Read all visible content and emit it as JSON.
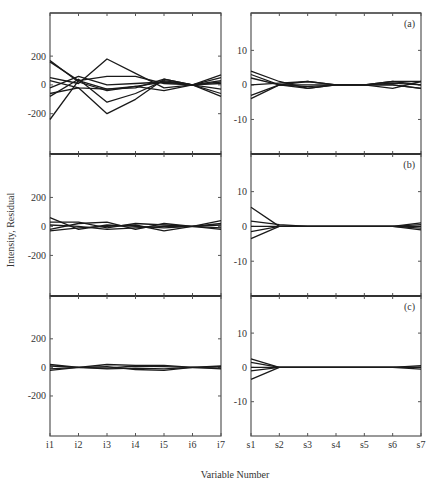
{
  "chart_data": {
    "type": "line",
    "layout": "3x2 stacked panels",
    "ylabel": "Intensity, Residual",
    "xlabel": "Variable Number",
    "grid": false,
    "legend": null,
    "panels": [
      {
        "tag": "(a)",
        "row": 0,
        "col": 0,
        "x": [
          "i1",
          "i2",
          "i3",
          "i4",
          "i5",
          "i6",
          "i7"
        ],
        "yticks": [
          200,
          0,
          -200
        ],
        "ylim": [
          -480,
          480
        ],
        "series": [
          {
            "name": "s1",
            "values": [
              170,
              20,
              -40,
              -10,
              20,
              0,
              70
            ]
          },
          {
            "name": "s2",
            "values": [
              160,
              30,
              -30,
              -20,
              40,
              0,
              -80
            ]
          },
          {
            "name": "s3",
            "values": [
              50,
              10,
              180,
              80,
              -20,
              0,
              50
            ]
          },
          {
            "name": "s4",
            "values": [
              -240,
              30,
              60,
              60,
              10,
              0,
              30
            ]
          },
          {
            "name": "s5",
            "values": [
              -60,
              -20,
              -200,
              -100,
              40,
              0,
              -30
            ]
          },
          {
            "name": "s6",
            "values": [
              -80,
              40,
              -120,
              -60,
              30,
              0,
              -60
            ]
          },
          {
            "name": "s7",
            "values": [
              30,
              -20,
              -30,
              -10,
              -40,
              0,
              10
            ]
          },
          {
            "name": "s8",
            "values": [
              -20,
              60,
              0,
              10,
              20,
              0,
              20
            ]
          }
        ]
      },
      {
        "tag": "(a)",
        "row": 0,
        "col": 1,
        "x": [
          "s1",
          "s2",
          "s3",
          "s4",
          "s5",
          "s6",
          "s7"
        ],
        "yticks": [
          10,
          0,
          -10
        ],
        "ylim": [
          -20,
          20
        ],
        "series": [
          {
            "name": "s1",
            "values": [
              4,
              1,
              -1,
              0,
              0,
              1,
              1
            ]
          },
          {
            "name": "s2",
            "values": [
              3,
              0,
              1,
              0,
              0,
              0,
              -1
            ]
          },
          {
            "name": "s3",
            "values": [
              2,
              0,
              -1,
              0,
              0,
              1,
              0
            ]
          },
          {
            "name": "s4",
            "values": [
              0,
              0.5,
              1,
              0,
              0,
              -1,
              1
            ]
          },
          {
            "name": "s5",
            "values": [
              -3,
              0,
              0,
              0,
              0,
              0,
              -1
            ]
          },
          {
            "name": "s6",
            "values": [
              -4,
              0,
              -0.5,
              0,
              0,
              0.5,
              0
            ]
          }
        ]
      },
      {
        "tag": "(b)",
        "row": 1,
        "col": 0,
        "x": [
          "i1",
          "i2",
          "i3",
          "i4",
          "i5",
          "i6",
          "i7"
        ],
        "yticks": [
          200,
          0,
          -200
        ],
        "ylim": [
          -480,
          480
        ],
        "series": [
          {
            "name": "s1",
            "values": [
              60,
              -20,
              10,
              0,
              -10,
              0,
              40
            ]
          },
          {
            "name": "s2",
            "values": [
              30,
              30,
              -10,
              20,
              10,
              0,
              -20
            ]
          },
          {
            "name": "s3",
            "values": [
              -20,
              20,
              30,
              -20,
              20,
              0,
              10
            ]
          },
          {
            "name": "s4",
            "values": [
              -30,
              -10,
              0,
              10,
              -30,
              0,
              -10
            ]
          },
          {
            "name": "s5",
            "values": [
              10,
              0,
              -20,
              -10,
              0,
              0,
              20
            ]
          }
        ]
      },
      {
        "tag": "(b)",
        "row": 1,
        "col": 1,
        "x": [
          "s1",
          "s2",
          "s3",
          "s4",
          "s5",
          "s6",
          "s7"
        ],
        "yticks": [
          10,
          0,
          -10
        ],
        "ylim": [
          -20,
          20
        ],
        "series": [
          {
            "name": "s1",
            "values": [
              5.5,
              0,
              0,
              0,
              0,
              0,
              1
            ]
          },
          {
            "name": "s2",
            "values": [
              1.5,
              0.5,
              0,
              0,
              0,
              0,
              -1
            ]
          },
          {
            "name": "s3",
            "values": [
              0,
              0,
              0,
              0,
              0,
              0,
              0.5
            ]
          },
          {
            "name": "s4",
            "values": [
              -1.5,
              0,
              0,
              0,
              0,
              0,
              -0.5
            ]
          },
          {
            "name": "s5",
            "values": [
              -3.5,
              0,
              0,
              0,
              0,
              0,
              0
            ]
          }
        ]
      },
      {
        "tag": "(c)",
        "row": 2,
        "col": 0,
        "x": [
          "i1",
          "i2",
          "i3",
          "i4",
          "i5",
          "i6",
          "i7"
        ],
        "yticks": [
          200,
          0,
          -200
        ],
        "ylim": [
          -480,
          480
        ],
        "series": [
          {
            "name": "s1",
            "values": [
              20,
              0,
              20,
              15,
              15,
              0,
              10
            ]
          },
          {
            "name": "s2",
            "values": [
              10,
              0,
              -5,
              10,
              5,
              0,
              -10
            ]
          },
          {
            "name": "s3",
            "values": [
              -10,
              0,
              5,
              -15,
              -20,
              0,
              5
            ]
          },
          {
            "name": "s4",
            "values": [
              -20,
              0,
              -10,
              -5,
              -10,
              0,
              -5
            ]
          }
        ]
      },
      {
        "tag": "(c)",
        "row": 2,
        "col": 1,
        "x": [
          "s1",
          "s2",
          "s3",
          "s4",
          "s5",
          "s6",
          "s7"
        ],
        "yticks": [
          10,
          0,
          -10
        ],
        "ylim": [
          -20,
          20
        ],
        "series": [
          {
            "name": "s1",
            "values": [
              2.5,
              0,
              0,
              0,
              0,
              0,
              0.5
            ]
          },
          {
            "name": "s2",
            "values": [
              1.5,
              0,
              0,
              0,
              0,
              0,
              -0.5
            ]
          },
          {
            "name": "s3",
            "values": [
              0,
              0,
              0,
              0,
              0,
              0,
              0
            ]
          },
          {
            "name": "s4",
            "values": [
              -1,
              0,
              0,
              0,
              0,
              0,
              0
            ]
          },
          {
            "name": "s5",
            "values": [
              -3.5,
              0,
              0,
              0,
              0,
              0,
              0
            ]
          }
        ]
      }
    ]
  }
}
